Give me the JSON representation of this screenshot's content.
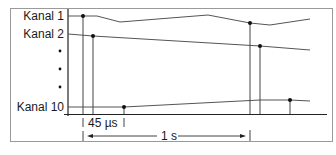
{
  "diagram": {
    "type": "multichannel-sampling-timing",
    "channels": [
      {
        "id": "kanal-1",
        "label": "Kanal 1"
      },
      {
        "id": "kanal-2",
        "label": "Kanal 2"
      },
      {
        "id": "kanal-10",
        "label": "Kanal 10"
      }
    ],
    "ellipsis_dots": 3,
    "annotations": {
      "channel_offset": "45 µs",
      "sample_period": "1 s"
    },
    "colors": {
      "line": "#555555",
      "axis": "#222222",
      "border": "#999999",
      "dot": "#111111"
    }
  }
}
